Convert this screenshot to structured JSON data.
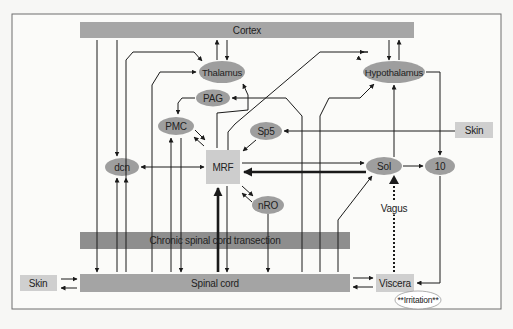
{
  "colors": {
    "bar": "#a4a4a4",
    "bar_dark": "#8c8c8c",
    "ellipse": "#9e9e9e",
    "box_light": "#cfcfcf",
    "line": "#1a1a1a",
    "frame": "#6e6e6e",
    "background": "#f7f7f5"
  },
  "nodes": {
    "cortex": "Cortex",
    "thalamus": "Thalamus",
    "pag": "PAG",
    "pmc": "PMC",
    "sp5": "Sp5",
    "hypothalamus": "Hypothalamus",
    "skin_right": "Skin",
    "dcn": "dcn",
    "mrf": "MRF",
    "nro": "nRO",
    "sol": "Sol",
    "ten": "10",
    "vagus": "Vagus",
    "transection": "Chronic spinal cord transection",
    "spinal_cord": "Spinal cord",
    "skin_left": "Skin",
    "viscera": "Viscera",
    "irritation": "**Irritation**"
  }
}
